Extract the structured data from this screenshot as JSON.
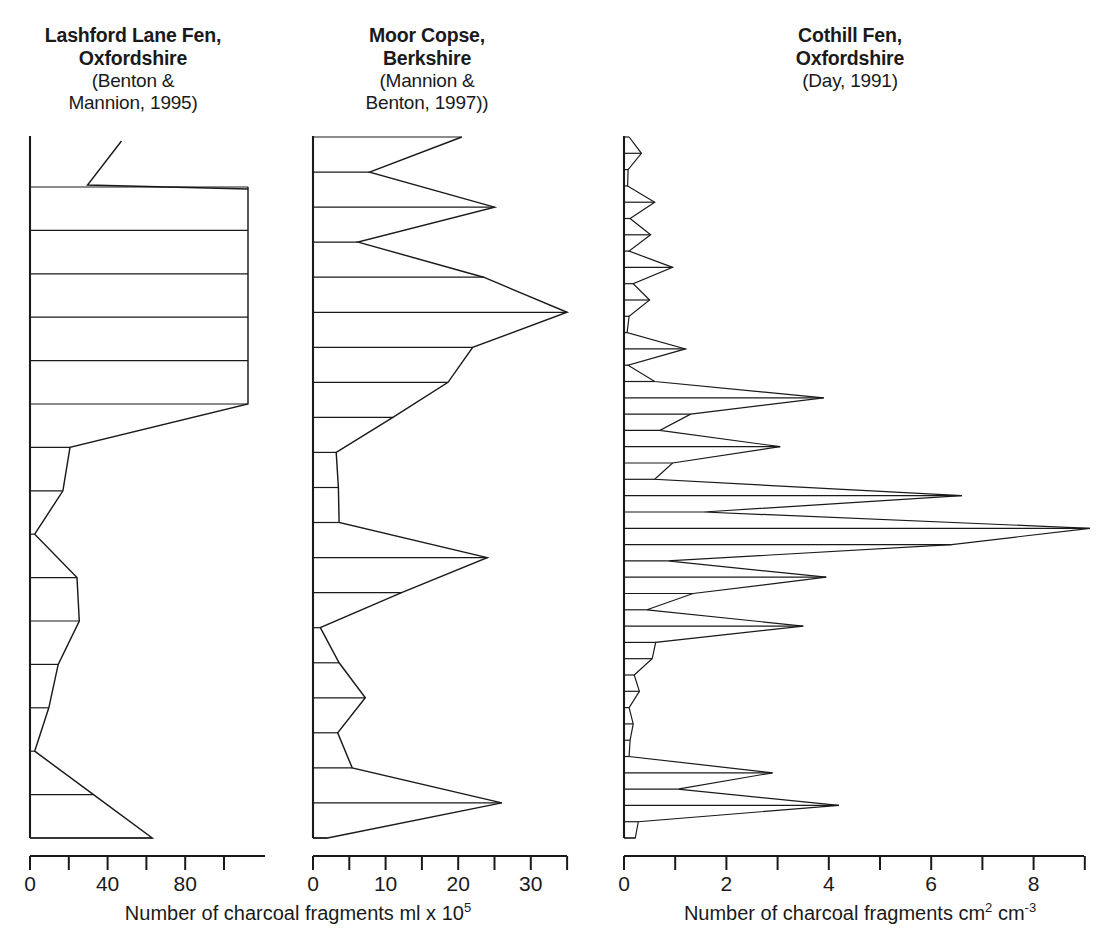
{
  "figure": {
    "kind": "charcoal-stratigraphic-diagram",
    "background_color": "#ffffff",
    "ink_color": "#1a1a1a"
  },
  "panels": [
    {
      "id": "lashford-lane-fen",
      "title_line1": "Lashford Lane Fen,",
      "title_line2": "Oxfordshire",
      "title_line3": "(Benton &",
      "title_line4": "Mannion, 1995)"
    },
    {
      "id": "moor-copse",
      "title_line1": "Moor Copse,",
      "title_line2": "Berkshire",
      "title_line3": "(Mannion &",
      "title_line4": "Benton, 1997))"
    },
    {
      "id": "cothill-fen",
      "title_line1": "Cothill Fen,",
      "title_line2": "Oxfordshire",
      "title_line3": "(Day, 1991)",
      "title_line4": ""
    }
  ],
  "axes": {
    "left_caption": "Number of charcoal fragments ml x 10",
    "left_caption_sup": "5",
    "right_caption_a": "Number of charcoal fragments cm",
    "right_caption_sup_a": "2",
    "right_caption_b": " cm",
    "right_caption_sup_b": "-3"
  },
  "chart_data": [
    {
      "type": "area",
      "id": "lashford-lane-fen",
      "title": "Lashford Lane Fen, Oxfordshire (Benton & Mannion, 1995)",
      "orientation": "horizontal-depth-profile",
      "xlabel": "Number of charcoal fragments ml x 10^5",
      "ylabel": "depth (relative, increasing downward)",
      "xlim": [
        0,
        100
      ],
      "xticks": [
        0,
        20,
        40,
        60,
        80,
        100
      ],
      "xtick_labels": [
        "0",
        "",
        "40",
        "",
        "80",
        ""
      ],
      "grid": false,
      "note": "Topmost two levels exceed the plotted axis; drawn as a detached open segment at upper right.",
      "values": [
        {
          "depth_index": 0,
          "value": 106
        },
        {
          "depth_index": 1,
          "value": 88
        },
        {
          "depth_index": 2,
          "value": 107
        },
        {
          "depth_index": 3,
          "value": 100
        },
        {
          "depth_index": 4,
          "value": 100
        },
        {
          "depth_index": 5,
          "value": 100
        },
        {
          "depth_index": 6,
          "value": 100
        },
        {
          "depth_index": 7,
          "value": 100
        },
        {
          "depth_index": 8,
          "value": 100
        },
        {
          "depth_index": 9,
          "value": 17
        },
        {
          "depth_index": 10,
          "value": 14
        },
        {
          "depth_index": 11,
          "value": 2
        },
        {
          "depth_index": 12,
          "value": 20
        },
        {
          "depth_index": 13,
          "value": 21
        },
        {
          "depth_index": 14,
          "value": 12
        },
        {
          "depth_index": 15,
          "value": 8
        },
        {
          "depth_index": 16,
          "value": 2
        },
        {
          "depth_index": 17,
          "value": 27
        },
        {
          "depth_index": 18,
          "value": 52
        }
      ]
    },
    {
      "type": "area",
      "id": "moor-copse",
      "title": "Moor Copse, Berkshire (Mannion & Benton, 1997)",
      "orientation": "horizontal-depth-profile",
      "xlabel": "Number of charcoal fragments ml x 10^5",
      "ylabel": "depth (relative, increasing downward)",
      "xlim": [
        0,
        35
      ],
      "xticks": [
        0,
        5,
        10,
        15,
        20,
        25,
        30,
        35
      ],
      "xtick_labels": [
        "0",
        "",
        "10",
        "",
        "20",
        "",
        "30",
        ""
      ],
      "grid": false,
      "values": [
        {
          "depth_index": 0,
          "value": 20.5
        },
        {
          "depth_index": 1,
          "value": 7.8
        },
        {
          "depth_index": 2,
          "value": 25.0
        },
        {
          "depth_index": 3,
          "value": 6.2
        },
        {
          "depth_index": 4,
          "value": 23.5
        },
        {
          "depth_index": 5,
          "value": 35.0
        },
        {
          "depth_index": 6,
          "value": 22.0
        },
        {
          "depth_index": 7,
          "value": 18.6
        },
        {
          "depth_index": 8,
          "value": 11.0
        },
        {
          "depth_index": 9,
          "value": 3.2
        },
        {
          "depth_index": 10,
          "value": 3.5
        },
        {
          "depth_index": 11,
          "value": 3.6
        },
        {
          "depth_index": 12,
          "value": 24.0
        },
        {
          "depth_index": 13,
          "value": 12.2
        },
        {
          "depth_index": 14,
          "value": 1.0
        },
        {
          "depth_index": 15,
          "value": 3.6
        },
        {
          "depth_index": 16,
          "value": 7.2
        },
        {
          "depth_index": 17,
          "value": 3.4
        },
        {
          "depth_index": 18,
          "value": 5.4
        },
        {
          "depth_index": 19,
          "value": 26.0
        },
        {
          "depth_index": 20,
          "value": 2.0
        }
      ]
    },
    {
      "type": "area",
      "id": "cothill-fen",
      "title": "Cothill Fen, Oxfordshire (Day, 1991)",
      "orientation": "horizontal-depth-profile",
      "xlabel": "Number of charcoal fragments cm2 cm-3",
      "ylabel": "depth (relative, increasing downward)",
      "xlim": [
        0,
        9
      ],
      "xticks": [
        0,
        1,
        2,
        3,
        4,
        5,
        6,
        7,
        8,
        9
      ],
      "xtick_labels": [
        "0",
        "",
        "2",
        "",
        "4",
        "",
        "6",
        "",
        "8",
        ""
      ],
      "grid": false,
      "values": [
        {
          "depth_index": 0,
          "value": 0.1
        },
        {
          "depth_index": 1,
          "value": 0.34
        },
        {
          "depth_index": 2,
          "value": 0.08
        },
        {
          "depth_index": 3,
          "value": 0.07
        },
        {
          "depth_index": 4,
          "value": 0.6
        },
        {
          "depth_index": 5,
          "value": 0.12
        },
        {
          "depth_index": 6,
          "value": 0.52
        },
        {
          "depth_index": 7,
          "value": 0.1
        },
        {
          "depth_index": 8,
          "value": 0.95
        },
        {
          "depth_index": 9,
          "value": 0.18
        },
        {
          "depth_index": 10,
          "value": 0.5
        },
        {
          "depth_index": 11,
          "value": 0.1
        },
        {
          "depth_index": 12,
          "value": 0.06
        },
        {
          "depth_index": 13,
          "value": 1.2
        },
        {
          "depth_index": 14,
          "value": 0.08
        },
        {
          "depth_index": 15,
          "value": 0.6
        },
        {
          "depth_index": 16,
          "value": 3.9
        },
        {
          "depth_index": 17,
          "value": 1.3
        },
        {
          "depth_index": 18,
          "value": 0.7
        },
        {
          "depth_index": 19,
          "value": 3.05
        },
        {
          "depth_index": 20,
          "value": 0.95
        },
        {
          "depth_index": 21,
          "value": 0.6
        },
        {
          "depth_index": 22,
          "value": 6.6
        },
        {
          "depth_index": 23,
          "value": 1.55
        },
        {
          "depth_index": 24,
          "value": 9.1
        },
        {
          "depth_index": 25,
          "value": 6.4
        },
        {
          "depth_index": 26,
          "value": 0.85
        },
        {
          "depth_index": 27,
          "value": 3.95
        },
        {
          "depth_index": 28,
          "value": 1.35
        },
        {
          "depth_index": 29,
          "value": 0.45
        },
        {
          "depth_index": 30,
          "value": 3.5
        },
        {
          "depth_index": 31,
          "value": 0.62
        },
        {
          "depth_index": 32,
          "value": 0.55
        },
        {
          "depth_index": 33,
          "value": 0.2
        },
        {
          "depth_index": 34,
          "value": 0.3
        },
        {
          "depth_index": 35,
          "value": 0.1
        },
        {
          "depth_index": 36,
          "value": 0.18
        },
        {
          "depth_index": 37,
          "value": 0.12
        },
        {
          "depth_index": 38,
          "value": 0.1
        },
        {
          "depth_index": 39,
          "value": 2.9
        },
        {
          "depth_index": 40,
          "value": 1.05
        },
        {
          "depth_index": 41,
          "value": 4.2
        },
        {
          "depth_index": 42,
          "value": 0.28
        },
        {
          "depth_index": 43,
          "value": 0.22
        }
      ]
    }
  ],
  "tick_labels": {
    "p1": [
      "0",
      "40",
      "80"
    ],
    "p2": [
      "0",
      "10",
      "20",
      "30"
    ],
    "p3": [
      "0",
      "2",
      "4",
      "6",
      "8"
    ]
  }
}
